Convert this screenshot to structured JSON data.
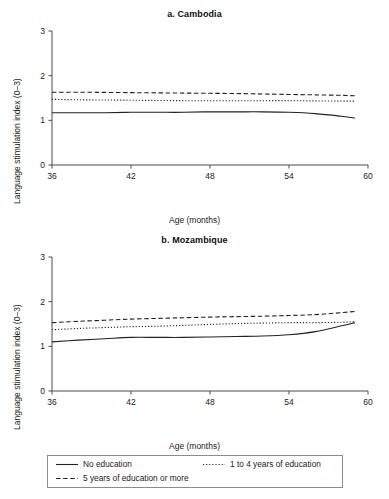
{
  "figure": {
    "xlabel": "Age (months)",
    "ylabel": "Language stimulation index (0–3)",
    "xticks": [
      "36",
      "42",
      "48",
      "54",
      "60"
    ],
    "yticks": [
      "0",
      "1",
      "2",
      "3"
    ]
  },
  "panels": [
    {
      "title": "a. Cambodia"
    },
    {
      "title": "b. Mozambique"
    }
  ],
  "legend": {
    "items": [
      {
        "label": "No education",
        "style": "solid"
      },
      {
        "label": "1 to 4 years of education",
        "style": "dotted"
      },
      {
        "label": "5 years of education or more",
        "style": "dashed"
      }
    ]
  },
  "chart_data": [
    {
      "type": "line",
      "title": "a. Cambodia",
      "xlabel": "Age (months)",
      "ylabel": "Language stimulation index (0–3)",
      "xlim": [
        36,
        60
      ],
      "ylim": [
        0,
        3
      ],
      "xticks": [
        36,
        42,
        48,
        54,
        60
      ],
      "yticks": [
        0,
        1,
        2,
        3
      ],
      "grid": false,
      "legend_position": "bottom",
      "x": [
        36,
        38,
        40,
        42,
        44,
        46,
        48,
        50,
        52,
        54,
        56,
        58,
        59
      ],
      "series": [
        {
          "name": "No education",
          "style": "solid",
          "values": [
            1.17,
            1.17,
            1.17,
            1.18,
            1.18,
            1.18,
            1.19,
            1.19,
            1.19,
            1.18,
            1.15,
            1.09,
            1.05
          ]
        },
        {
          "name": "1 to 4 years of education",
          "style": "dotted",
          "values": [
            1.47,
            1.46,
            1.455,
            1.45,
            1.445,
            1.44,
            1.44,
            1.44,
            1.44,
            1.44,
            1.435,
            1.43,
            1.43
          ]
        },
        {
          "name": "5 years of education or more",
          "style": "dashed",
          "values": [
            1.63,
            1.63,
            1.625,
            1.62,
            1.615,
            1.61,
            1.605,
            1.6,
            1.59,
            1.58,
            1.57,
            1.56,
            1.55
          ]
        }
      ]
    },
    {
      "type": "line",
      "title": "b. Mozambique",
      "xlabel": "Age (months)",
      "ylabel": "Language stimulation index (0–3)",
      "xlim": [
        36,
        60
      ],
      "ylim": [
        0,
        3
      ],
      "xticks": [
        36,
        42,
        48,
        54,
        60
      ],
      "yticks": [
        0,
        1,
        2,
        3
      ],
      "grid": false,
      "legend_position": "bottom",
      "x": [
        36,
        38,
        40,
        42,
        44,
        46,
        48,
        50,
        52,
        54,
        56,
        58,
        59
      ],
      "series": [
        {
          "name": "No education",
          "style": "solid",
          "values": [
            1.1,
            1.14,
            1.17,
            1.2,
            1.2,
            1.2,
            1.21,
            1.22,
            1.23,
            1.26,
            1.33,
            1.46,
            1.53
          ]
        },
        {
          "name": "1 to 4 years of education",
          "style": "dotted",
          "values": [
            1.37,
            1.4,
            1.42,
            1.44,
            1.45,
            1.47,
            1.49,
            1.51,
            1.52,
            1.53,
            1.53,
            1.54,
            1.55
          ]
        },
        {
          "name": "5 years of education or more",
          "style": "dashed",
          "values": [
            1.53,
            1.56,
            1.585,
            1.61,
            1.625,
            1.64,
            1.655,
            1.665,
            1.675,
            1.69,
            1.71,
            1.755,
            1.78
          ]
        }
      ]
    }
  ]
}
